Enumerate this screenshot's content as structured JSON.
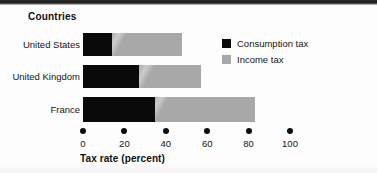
{
  "figure": {
    "category_axis_title": "Countries",
    "x_axis_title": "Tax rate (percent)"
  },
  "legend": {
    "position": "top-right",
    "items": [
      {
        "label": "Consumption tax",
        "color": "#0a0a0a",
        "swatch": "black-square-icon"
      },
      {
        "label": "Income tax",
        "color": "#a8a8a8",
        "swatch": "gray-square-icon"
      }
    ]
  },
  "chart_data": {
    "type": "bar",
    "orientation": "horizontal",
    "stacked": true,
    "title": "",
    "subtitle": "",
    "xlabel": "Tax rate (percent)",
    "ylabel": "Countries",
    "xlim": [
      0,
      100
    ],
    "xticks": [
      0,
      20,
      40,
      60,
      80,
      100
    ],
    "xticklabels": [
      "0",
      "20",
      "40",
      "60",
      "80",
      "100"
    ],
    "grid": false,
    "legend_position": "top-right",
    "categories": [
      "United States",
      "United Kingdom",
      "France"
    ],
    "series": [
      {
        "name": "Consumption tax",
        "color": "#0a0a0a",
        "values": [
          14,
          27,
          35
        ]
      },
      {
        "name": "Income tax",
        "color": "#a8a8a8",
        "values": [
          34,
          30,
          48
        ]
      }
    ],
    "totals": [
      48,
      57,
      83
    ]
  }
}
